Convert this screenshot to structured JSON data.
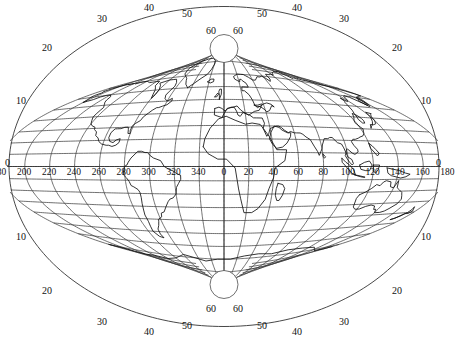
{
  "figure": {
    "type": "map",
    "projection_name": "transverse-oblique-graticule-world-map",
    "background_color": "#ffffff",
    "graticule_color": "#333333",
    "coastline_color": "#111111",
    "width": 448,
    "height": 345
  },
  "chart_data": {
    "type": "map",
    "title": "",
    "graticule": {
      "longitude_step": 20,
      "latitude_step": 10,
      "longitude_range": [
        180,
        180
      ],
      "latitude_range": [
        -90,
        90
      ]
    },
    "equator_longitude_labels": [
      "180",
      "200",
      "220",
      "240",
      "260",
      "280",
      "300",
      "320",
      "340",
      "0",
      "20",
      "40",
      "60",
      "80",
      "100",
      "120",
      "140",
      "160",
      "180"
    ],
    "left_edge_latitude_labels": [
      "0",
      "10",
      "20"
    ],
    "right_edge_latitude_labels": [
      "0",
      "10",
      "20"
    ],
    "top_arc_latitude_labels_left": [
      "20",
      "30",
      "40",
      "50",
      "60"
    ],
    "top_arc_latitude_labels_right": [
      "60",
      "50",
      "40",
      "30",
      "20"
    ],
    "bottom_arc_latitude_labels_left": [
      "20",
      "30",
      "40",
      "50",
      "60"
    ],
    "bottom_arc_latitude_labels_right": [
      "60",
      "50",
      "40",
      "30",
      "20"
    ]
  },
  "labels": {
    "equator_left_zero": "0",
    "equator_right_zero": "0",
    "longitudes": [
      {
        "text": "180",
        "x": 54,
        "y": 174
      },
      {
        "text": "200",
        "x": 78,
        "y": 174
      },
      {
        "text": "220",
        "x": 103,
        "y": 174
      },
      {
        "text": "240",
        "x": 128,
        "y": 174
      },
      {
        "text": "260",
        "x": 152,
        "y": 174
      },
      {
        "text": "280",
        "x": 177,
        "y": 174
      },
      {
        "text": "300",
        "x": 201,
        "y": 174
      },
      {
        "text": "320",
        "x": 225,
        "y": 174
      },
      {
        "text": "340",
        "x": 249,
        "y": 174
      },
      {
        "text": "0",
        "x": 278,
        "y": 174
      },
      {
        "text": "20",
        "x": 299,
        "y": 174
      },
      {
        "text": "40",
        "x": 323,
        "y": 174
      },
      {
        "text": "60",
        "x": 347,
        "y": 174
      },
      {
        "text": "80",
        "x": 371,
        "y": 174
      },
      {
        "text": "100",
        "x": 392,
        "y": 174
      },
      {
        "text": "120",
        "x": 416,
        "y": 174
      },
      {
        "text": "140",
        "x": 441,
        "y": 174
      },
      {
        "text": "160",
        "x": 465,
        "y": 174
      },
      {
        "text": "180",
        "x": 489,
        "y": 174
      }
    ],
    "latitudes": [
      {
        "text": "0",
        "x": 6,
        "y": 162
      },
      {
        "text": "10",
        "x": 18,
        "y": 98
      },
      {
        "text": "20",
        "x": 45,
        "y": 46
      },
      {
        "text": "30",
        "x": 99,
        "y": 16
      },
      {
        "text": "40",
        "x": 146,
        "y": 5
      },
      {
        "text": "50",
        "x": 184,
        "y": 10
      },
      {
        "text": "60",
        "x": 209,
        "y": 26
      },
      {
        "text": "60",
        "x": 236,
        "y": 26
      },
      {
        "text": "50",
        "x": 262,
        "y": 10
      },
      {
        "text": "40",
        "x": 297,
        "y": 5
      },
      {
        "text": "30",
        "x": 343,
        "y": 16
      },
      {
        "text": "20",
        "x": 399,
        "y": 46
      },
      {
        "text": "10",
        "x": 424,
        "y": 98
      },
      {
        "text": "0",
        "x": 437,
        "y": 162
      },
      {
        "text": "10",
        "x": 18,
        "y": 234
      },
      {
        "text": "20",
        "x": 45,
        "y": 286
      },
      {
        "text": "30",
        "x": 99,
        "y": 316
      },
      {
        "text": "40",
        "x": 146,
        "y": 327
      },
      {
        "text": "50",
        "x": 184,
        "y": 322
      },
      {
        "text": "60",
        "x": 209,
        "y": 306
      },
      {
        "text": "60",
        "x": 236,
        "y": 306
      },
      {
        "text": "50",
        "x": 262,
        "y": 322
      },
      {
        "text": "40",
        "x": 297,
        "y": 327
      },
      {
        "text": "30",
        "x": 343,
        "y": 316
      },
      {
        "text": "20",
        "x": 399,
        "y": 286
      },
      {
        "text": "10",
        "x": 424,
        "y": 234
      }
    ]
  }
}
